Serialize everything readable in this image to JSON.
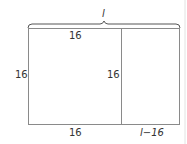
{
  "diagram": {
    "top_brace_label": "l",
    "labels": {
      "top_left_width": "16",
      "left_height": "16",
      "inner_height": "16",
      "bottom_left_width": "16",
      "bottom_right_width": "l−16"
    },
    "colors": {
      "stroke": "#8a8a8a",
      "brace": "#555555",
      "text": "#333333",
      "page_edge": "#e2e2e2"
    }
  }
}
